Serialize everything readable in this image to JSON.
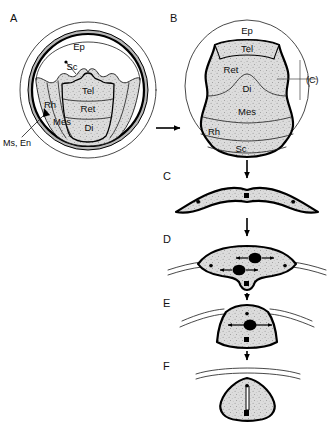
{
  "figure": {
    "background_color": "#ffffff",
    "ink_color": "#000000",
    "tissue_fill_color": "#d9d9d9",
    "ring_band_color": "#b8b8b8"
  },
  "panels": [
    {
      "id": "A",
      "letter": "A",
      "description": "Dorsal view of embryo within extraembryonic membranes showing early neural plate subdivisions",
      "labels": [
        {
          "key": "ep",
          "text": "Ep"
        },
        {
          "key": "sc",
          "text": "Sc"
        },
        {
          "key": "tel",
          "text": "Tel"
        },
        {
          "key": "ret",
          "text": "Ret"
        },
        {
          "key": "di",
          "text": "Di"
        },
        {
          "key": "mes",
          "text": "Mes"
        },
        {
          "key": "rh",
          "text": "Rh"
        },
        {
          "key": "ms_en",
          "text": "Ms, En"
        }
      ]
    },
    {
      "id": "B",
      "letter": "B",
      "description": "Enlarged dorsal view of neural plate with labelled brain subdivisions and section plane C",
      "labels": [
        {
          "key": "ep",
          "text": "Ep"
        },
        {
          "key": "tel",
          "text": "Tel"
        },
        {
          "key": "ret",
          "text": "Ret"
        },
        {
          "key": "di",
          "text": "Di"
        },
        {
          "key": "mes",
          "text": "Mes"
        },
        {
          "key": "rh",
          "text": "Rh"
        },
        {
          "key": "sc",
          "text": "Sc"
        },
        {
          "key": "section",
          "text": "(C)"
        }
      ]
    },
    {
      "id": "C",
      "letter": "C",
      "description": "Transverse section: flat neural plate stage"
    },
    {
      "id": "D",
      "letter": "D",
      "description": "Transverse section: neural groove forming, lateral expansion arrows"
    },
    {
      "id": "E",
      "letter": "E",
      "description": "Transverse section: neural folds elevating, keyhole shape"
    },
    {
      "id": "F",
      "letter": "F",
      "description": "Transverse section: closed neural tube with narrow lumen"
    }
  ],
  "abbreviations": {
    "Ep": "Epidermis",
    "Sc": "Spinal cord",
    "Tel": "Telencephalon",
    "Ret": "Retina",
    "Di": "Diencephalon",
    "Mes": "Mesencephalon",
    "Rh": "Rhombencephalon",
    "Ms, En": "Mesoderm, Endoderm"
  },
  "flow_arrows": [
    {
      "key": "a_to_b",
      "direction": "right"
    },
    {
      "key": "b_to_c",
      "direction": "down"
    },
    {
      "key": "c_to_d",
      "direction": "down"
    },
    {
      "key": "d_to_e",
      "direction": "down"
    },
    {
      "key": "e_to_f",
      "direction": "down"
    }
  ]
}
